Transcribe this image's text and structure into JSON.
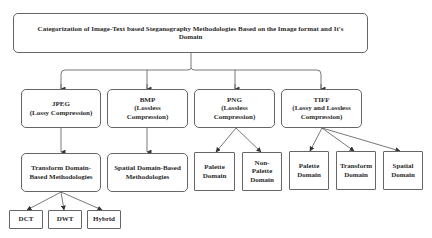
{
  "root": {
    "label": "Categorization of Image-Text based Steganography Methodologies Based on the Image format and It's\nDomain"
  },
  "formats": [
    {
      "label": "JPEG\n(Lossy Compression)"
    },
    {
      "label": "BMP\n(Lossless\nCompression)"
    },
    {
      "label": "PNG\n(Lossless\nCompression)"
    },
    {
      "label": "TIFF\n(Lossy and Lossless\nCompression)"
    }
  ],
  "methods": {
    "jpeg": {
      "label": "Transform Domain-\nBased Methodologies"
    },
    "bmp": {
      "label": "Spatial Domain-Based\nMethodologies"
    }
  },
  "png_children": [
    {
      "label": "Palette\nDomain"
    },
    {
      "label": "Non-\nPalette\nDomain"
    }
  ],
  "tiff_children": [
    {
      "label": "Palette\nDomain"
    },
    {
      "label": "Transform\nDomain"
    },
    {
      "label": "Spatial\nDomain"
    }
  ],
  "transform_children": [
    {
      "label": "DCT"
    },
    {
      "label": "DWT"
    },
    {
      "label": "Hybrid"
    }
  ],
  "colors": {
    "stroke": "#555555",
    "text": "#2a2a2a",
    "background": "#ffffff"
  }
}
